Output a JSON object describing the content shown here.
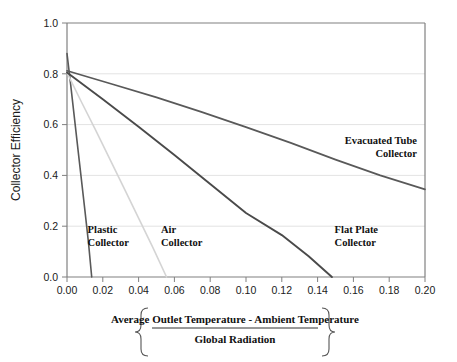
{
  "chart_data": {
    "type": "line",
    "title": "",
    "xlabel_numerator": "Average Outlet Temperature - Ambient Temperature",
    "xlabel_denominator": "Global Radiation",
    "ylabel": "Collector Efficiency",
    "xlim": [
      0.0,
      0.2
    ],
    "ylim": [
      0.0,
      1.0
    ],
    "grid": true,
    "legend_position": "inline-annotations",
    "xticks": [
      "0.00",
      "0.02",
      "0.04",
      "0.06",
      "0.08",
      "0.10",
      "0.12",
      "0.14",
      "0.16",
      "0.18",
      "0.20"
    ],
    "xtick_values": [
      0.0,
      0.02,
      0.04,
      0.06,
      0.08,
      0.1,
      0.12,
      0.14,
      0.16,
      0.18,
      0.2
    ],
    "yticks": [
      "0.0",
      "0.2",
      "0.4",
      "0.6",
      "0.8",
      "1.0"
    ],
    "ytick_values": [
      0.0,
      0.2,
      0.4,
      0.6,
      0.8,
      1.0
    ],
    "series": [
      {
        "name": "Plastic Collector",
        "color": "#595959",
        "width": 1.6,
        "label_line1": "Plastic",
        "label_line2": "Collector",
        "label_x": 0.0115,
        "label_y": 0.175,
        "label_anchor": "start",
        "points": [
          {
            "x": 0.0,
            "y": 0.88
          },
          {
            "x": 0.002,
            "y": 0.76
          },
          {
            "x": 0.004,
            "y": 0.635
          },
          {
            "x": 0.006,
            "y": 0.51
          },
          {
            "x": 0.008,
            "y": 0.386
          },
          {
            "x": 0.01,
            "y": 0.262
          },
          {
            "x": 0.012,
            "y": 0.135
          },
          {
            "x": 0.0138,
            "y": 0.0
          }
        ]
      },
      {
        "name": "Air Collector",
        "color": "#d4d4d4",
        "width": 1.6,
        "label_line1": "Air",
        "label_line2": "Collector",
        "label_x": 0.0525,
        "label_y": 0.175,
        "label_anchor": "start",
        "points": [
          {
            "x": 0.0,
            "y": 0.805
          },
          {
            "x": 0.008,
            "y": 0.69
          },
          {
            "x": 0.016,
            "y": 0.578
          },
          {
            "x": 0.024,
            "y": 0.463
          },
          {
            "x": 0.032,
            "y": 0.348
          },
          {
            "x": 0.04,
            "y": 0.232
          },
          {
            "x": 0.048,
            "y": 0.116
          },
          {
            "x": 0.0556,
            "y": 0.0
          }
        ]
      },
      {
        "name": "Flat Plate Collector",
        "color": "#4a4a4a",
        "width": 1.9,
        "label_line1": "Flat Plate",
        "label_line2": "Collector",
        "label_x": 0.1495,
        "label_y": 0.175,
        "label_anchor": "start",
        "points": [
          {
            "x": 0.0,
            "y": 0.805
          },
          {
            "x": 0.02,
            "y": 0.7
          },
          {
            "x": 0.04,
            "y": 0.592
          },
          {
            "x": 0.06,
            "y": 0.48
          },
          {
            "x": 0.08,
            "y": 0.366
          },
          {
            "x": 0.1,
            "y": 0.252
          },
          {
            "x": 0.12,
            "y": 0.165
          },
          {
            "x": 0.135,
            "y": 0.082
          },
          {
            "x": 0.148,
            "y": 0.0
          }
        ]
      },
      {
        "name": "Evacuated Tube Collector",
        "color": "#595959",
        "width": 1.7,
        "label_line1": "Evacuated Tube",
        "label_line2": "Collector",
        "label_x": 0.1955,
        "label_y": 0.525,
        "label_anchor": "end",
        "points": [
          {
            "x": 0.0,
            "y": 0.812
          },
          {
            "x": 0.025,
            "y": 0.76
          },
          {
            "x": 0.05,
            "y": 0.707
          },
          {
            "x": 0.075,
            "y": 0.65
          },
          {
            "x": 0.1,
            "y": 0.59
          },
          {
            "x": 0.125,
            "y": 0.528
          },
          {
            "x": 0.15,
            "y": 0.462
          },
          {
            "x": 0.175,
            "y": 0.4
          },
          {
            "x": 0.2,
            "y": 0.345
          }
        ]
      }
    ],
    "colors": {
      "axis": "#808080",
      "grid": "#e3e3e3",
      "text": "#1a1a1a",
      "background": "#ffffff"
    }
  }
}
